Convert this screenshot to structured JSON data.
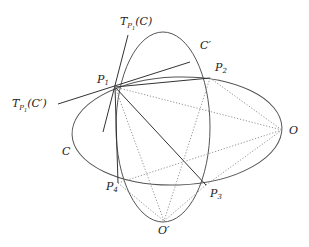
{
  "labels": {
    "tangent_C": {
      "base": "T",
      "sub": "P",
      "subsub": "1",
      "arg": "(C)"
    },
    "tangent_Cprime": {
      "base": "T",
      "sub": "P",
      "subsub": "1",
      "arg": "(C′)"
    },
    "curve_C": "C",
    "curve_Cprime": "C′",
    "P1": {
      "base": "P",
      "sub": "1"
    },
    "P2": {
      "base": "P",
      "sub": "2"
    },
    "P3": {
      "base": "P",
      "sub": "3"
    },
    "P4": {
      "base": "P",
      "sub": "4"
    },
    "O": "O",
    "Oprime": "O′"
  }
}
